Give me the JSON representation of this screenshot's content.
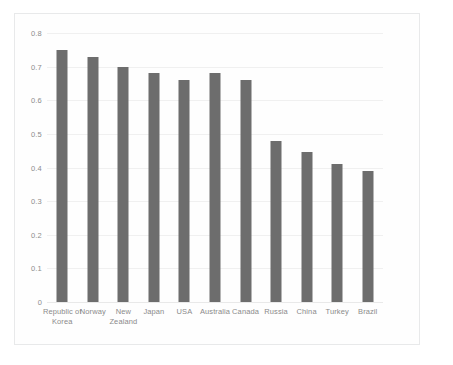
{
  "chart_data": {
    "type": "bar",
    "title": "",
    "subtitle": "",
    "xlabel": "",
    "ylabel": "",
    "categories": [
      "Republic of Korea",
      "Norway",
      "New Zealand",
      "Japan",
      "USA",
      "Australia",
      "Canada",
      "Russia",
      "China",
      "Turkey",
      "Brazil"
    ],
    "values": [
      0.75,
      0.73,
      0.7,
      0.68,
      0.66,
      0.68,
      0.66,
      0.48,
      0.445,
      0.41,
      0.39
    ],
    "ylim": [
      0,
      0.8
    ],
    "ytick_values": [
      0,
      0.1,
      0.2,
      0.3,
      0.4,
      0.5,
      0.6,
      0.7,
      0.8
    ],
    "ytick_labels": [
      "0",
      "0.1",
      "0.2",
      "0.3",
      "0.4",
      "0.5",
      "0.6",
      "0.7",
      "0.8"
    ],
    "grid": true,
    "legend": false,
    "legend_position": "none",
    "bar_color": "#6d6d6d",
    "gridline_color": "#f0f0f0",
    "axis_text_color": "#8b8b8b"
  }
}
